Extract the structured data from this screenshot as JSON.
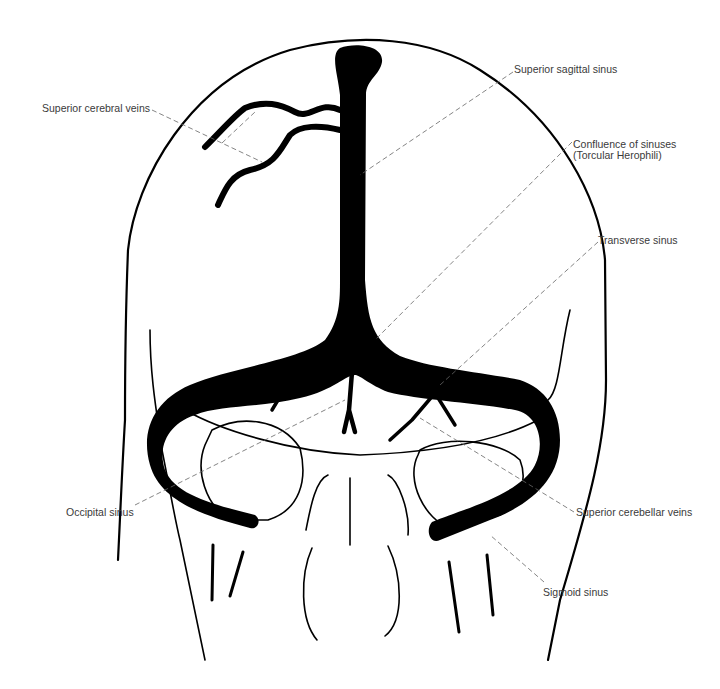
{
  "diagram": {
    "colors": {
      "vein_fill": "#000000",
      "outline": "#000000",
      "label_text": "#3a3a3a",
      "leader_line": "#666666",
      "background": "#ffffff"
    },
    "labels": {
      "superior_cerebral_veins": "Superior cerebral veins",
      "superior_sagittal_sinus": "Superior sagittal sinus",
      "confluence_line1": "Confluence of sinuses",
      "confluence_line2": "(Torcular Herophili)",
      "transverse_sinus": "Transverse sinus",
      "occipital_sinus": "Occipital sinus",
      "superior_cerebellar_veins": "Superior cerebellar veins",
      "sigmoid_sinus": "Sigmoid sinus"
    }
  }
}
